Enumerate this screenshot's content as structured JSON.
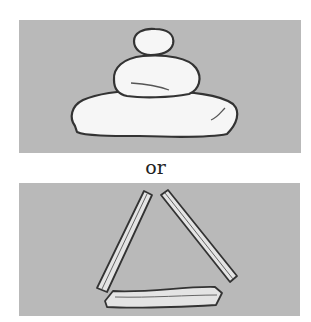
{
  "figure": {
    "top_panel": {
      "subject": "stacked-stones-cairn",
      "stones": 3
    },
    "separator_label": "or",
    "bottom_panel": {
      "subject": "three-sticks-triangle",
      "sticks": 3
    },
    "colors": {
      "panel": "#b9b9b9",
      "object_fill": "#f6f6f6",
      "outline": "#333333",
      "background": "#ffffff"
    }
  }
}
